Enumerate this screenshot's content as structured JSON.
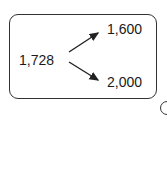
{
  "diagram": {
    "source": {
      "label": "1,728"
    },
    "targets": [
      {
        "label": "1,600",
        "position": "upper"
      },
      {
        "label": "2,000",
        "position": "lower"
      }
    ],
    "stroke_color": "#333333"
  }
}
